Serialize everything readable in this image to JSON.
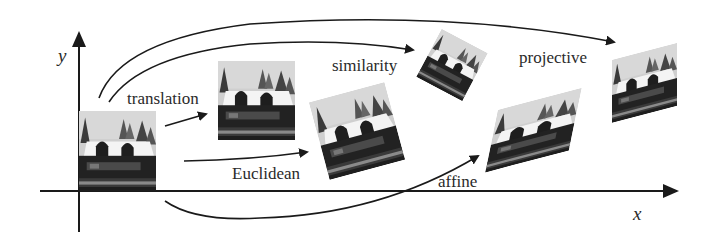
{
  "figure": {
    "axes": {
      "x_label": "x",
      "y_label": "y"
    },
    "transformations": [
      {
        "name": "translation",
        "label": "translation"
      },
      {
        "name": "euclidean",
        "label": "Euclidean"
      },
      {
        "name": "similarity",
        "label": "similarity"
      },
      {
        "name": "affine",
        "label": "affine"
      },
      {
        "name": "projective",
        "label": "projective"
      }
    ],
    "colors": {
      "ink": "#1a1a1a",
      "background": "#ffffff",
      "photo_sky": "#c9c9c9",
      "photo_house": "#1c1c1c",
      "photo_roof": "#f2f2f2"
    }
  }
}
